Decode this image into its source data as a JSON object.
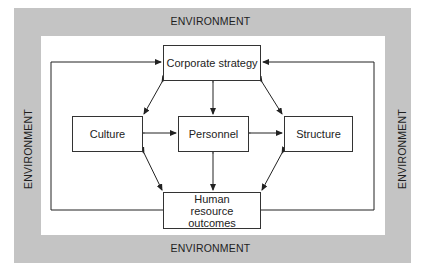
{
  "diagram": {
    "environment_labels": {
      "top": "ENVIRONMENT",
      "bottom": "ENVIRONMENT",
      "left": "ENVIRONMENT",
      "right": "ENVIRONMENT"
    },
    "nodes": {
      "corporate_strategy": "Corporate strategy",
      "culture": "Culture",
      "personnel": "Personnel",
      "structure": "Structure",
      "hr_outcomes": "Human resource outcomes"
    },
    "edges": [
      {
        "from": "corporate_strategy",
        "to": "culture",
        "type": "bidirectional"
      },
      {
        "from": "corporate_strategy",
        "to": "personnel",
        "type": "bidirectional"
      },
      {
        "from": "corporate_strategy",
        "to": "structure",
        "type": "bidirectional"
      },
      {
        "from": "culture",
        "to": "personnel",
        "type": "bidirectional"
      },
      {
        "from": "personnel",
        "to": "structure",
        "type": "bidirectional"
      },
      {
        "from": "culture",
        "to": "hr_outcomes",
        "type": "bidirectional"
      },
      {
        "from": "personnel",
        "to": "hr_outcomes",
        "type": "bidirectional"
      },
      {
        "from": "structure",
        "to": "hr_outcomes",
        "type": "bidirectional"
      },
      {
        "from": "hr_outcomes",
        "to": "corporate_strategy",
        "type": "feedback-left"
      },
      {
        "from": "hr_outcomes",
        "to": "corporate_strategy",
        "type": "feedback-right"
      }
    ],
    "colors": {
      "environment_band": "#c4c4c4",
      "inner_background": "#ffffff",
      "line": "#222222"
    }
  }
}
